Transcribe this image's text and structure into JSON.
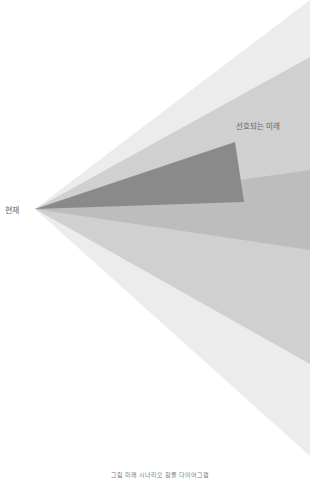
{
  "diagram": {
    "type": "futures-cone",
    "labels": {
      "present": "현재",
      "preferred_future": "선호되는 미래"
    },
    "caption": "그림 미래 시나리오 원뿔 다이어그램",
    "layers": [
      {
        "name": "possible",
        "color": "#ececec",
        "points": "35,209 310,0 310,456"
      },
      {
        "name": "plausible",
        "color": "#d0d0d0",
        "points": "35,209 310,57 310,364"
      },
      {
        "name": "probable",
        "color": "#bdbdbd",
        "points": "35,209 310,170 310,250"
      },
      {
        "name": "preferable",
        "color": "#8a8a8a",
        "points": "35,209 235,142 244,202"
      }
    ]
  }
}
